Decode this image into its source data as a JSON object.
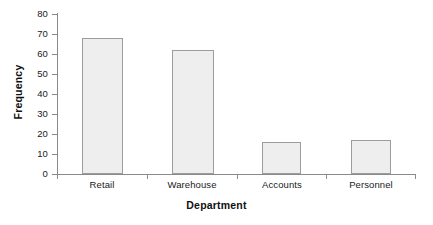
{
  "chart_data": {
    "type": "bar",
    "title": "",
    "subtitle": "",
    "xlabel": "Department",
    "ylabel": "Frequency",
    "categories": [
      "Retail",
      "Warehouse",
      "Accounts",
      "Personnel"
    ],
    "values": [
      68,
      62,
      16,
      17
    ],
    "ylim": [
      0,
      80
    ],
    "ytick_labels": [
      "80",
      "70",
      "60",
      "50",
      "40",
      "30",
      "20",
      "10",
      "0"
    ],
    "ytick_values": [
      80,
      70,
      60,
      50,
      40,
      30,
      20,
      10,
      0
    ],
    "ytick_step": 10,
    "grid": false,
    "legend": null,
    "legend_position": "none",
    "annotations": [],
    "colors": {
      "bar_fill": "#eeeeee",
      "bar_edge": "#9c9c9c",
      "axis": "#8a8a8a",
      "text": "#1a1a1a",
      "title_text": "#101010",
      "background": "#ffffff"
    }
  }
}
